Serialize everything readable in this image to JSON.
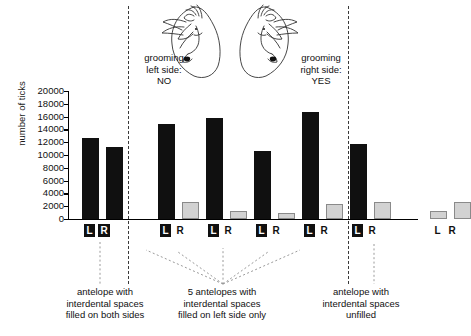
{
  "chart_data": {
    "type": "bar",
    "title": "",
    "xlabel": "",
    "ylabel": "number of ticks",
    "ylim": [
      0,
      20000
    ],
    "ytick_values": [
      20000,
      18000,
      16000,
      14000,
      12000,
      10000,
      8000,
      6000,
      4000,
      2000,
      0
    ],
    "ytick_labels": [
      "20000",
      "18000",
      "16000",
      "14000",
      "12000",
      "10000",
      "8000",
      "6000",
      "4000",
      "2000",
      "0"
    ],
    "grid": false,
    "legend": "none",
    "categories": [
      "L",
      "R",
      "L",
      "R",
      "L",
      "R",
      "L",
      "R",
      "L",
      "R",
      "L",
      "R",
      "L",
      "R"
    ],
    "groups": [
      {
        "group_id": "both-sides-filled",
        "side_labels": [
          {
            "text": "L",
            "style": "boxed"
          },
          {
            "text": "R",
            "style": "boxed"
          }
        ],
        "bars": [
          {
            "side": "L",
            "value": 12600,
            "color": "#101010",
            "style": "black"
          },
          {
            "side": "R",
            "value": 11200,
            "color": "#101010",
            "style": "black"
          }
        ]
      },
      {
        "group_id": "left-only-1",
        "side_labels": [
          {
            "text": "L",
            "style": "boxed"
          },
          {
            "text": "R",
            "style": "plain"
          }
        ],
        "bars": [
          {
            "side": "L",
            "value": 14800,
            "color": "#101010",
            "style": "black"
          },
          {
            "side": "R",
            "value": 2600,
            "color": "#d2d2d2",
            "style": "grey"
          }
        ]
      },
      {
        "group_id": "left-only-2",
        "side_labels": [
          {
            "text": "L",
            "style": "boxed"
          },
          {
            "text": "R",
            "style": "plain"
          }
        ],
        "bars": [
          {
            "side": "L",
            "value": 15800,
            "color": "#101010",
            "style": "black"
          },
          {
            "side": "R",
            "value": 1300,
            "color": "#d2d2d2",
            "style": "grey"
          }
        ]
      },
      {
        "group_id": "left-only-3",
        "side_labels": [
          {
            "text": "L",
            "style": "boxed"
          },
          {
            "text": "R",
            "style": "plain"
          }
        ],
        "bars": [
          {
            "side": "L",
            "value": 10700,
            "color": "#101010",
            "style": "black"
          },
          {
            "side": "R",
            "value": 900,
            "color": "#d2d2d2",
            "style": "grey"
          }
        ]
      },
      {
        "group_id": "left-only-4",
        "side_labels": [
          {
            "text": "L",
            "style": "boxed"
          },
          {
            "text": "R",
            "style": "plain"
          }
        ],
        "bars": [
          {
            "side": "L",
            "value": 16700,
            "color": "#101010",
            "style": "black"
          },
          {
            "side": "R",
            "value": 2400,
            "color": "#d2d2d2",
            "style": "grey"
          }
        ]
      },
      {
        "group_id": "left-only-5",
        "side_labels": [
          {
            "text": "L",
            "style": "boxed"
          },
          {
            "text": "R",
            "style": "plain"
          }
        ],
        "bars": [
          {
            "side": "L",
            "value": 11700,
            "color": "#101010",
            "style": "black"
          },
          {
            "side": "R",
            "value": 2600,
            "color": "#d2d2d2",
            "style": "grey"
          }
        ]
      },
      {
        "group_id": "unfilled",
        "side_labels": [
          {
            "text": "L",
            "style": "plain"
          },
          {
            "text": "R",
            "style": "plain"
          }
        ],
        "bars": [
          {
            "side": "L",
            "value": 1300,
            "color": "#d2d2d2",
            "style": "grey"
          },
          {
            "side": "R",
            "value": 2600,
            "color": "#d2d2d2",
            "style": "grey"
          }
        ]
      }
    ],
    "annotations": [
      {
        "id": "grooming-left",
        "text": "grooming\nleft side:\nNO"
      },
      {
        "id": "grooming-right",
        "text": "grooming\nright side:\nYES"
      }
    ],
    "captions": [
      {
        "id": "caption-left",
        "text": "antelope with\ninterdental spaces\nfilled on both sides"
      },
      {
        "id": "caption-middle",
        "text": "5 antelopes with\ninterdental spaces\nfilled on left side only"
      },
      {
        "id": "caption-right",
        "text": "antelope with\ninterdental spaces\nunfilled"
      }
    ],
    "colors": {
      "bar_black": "#101010",
      "bar_grey_fill": "#d2d2d2",
      "bar_grey_stroke": "#8a8a8a",
      "axis": "#000000",
      "divider": "#3a3a3a",
      "text": "#111111"
    },
    "illustrations": [
      {
        "id": "antelope-head-left",
        "description": "line drawing of antelope head facing right"
      },
      {
        "id": "antelope-head-right",
        "description": "line drawing of antelope head facing left"
      }
    ]
  }
}
